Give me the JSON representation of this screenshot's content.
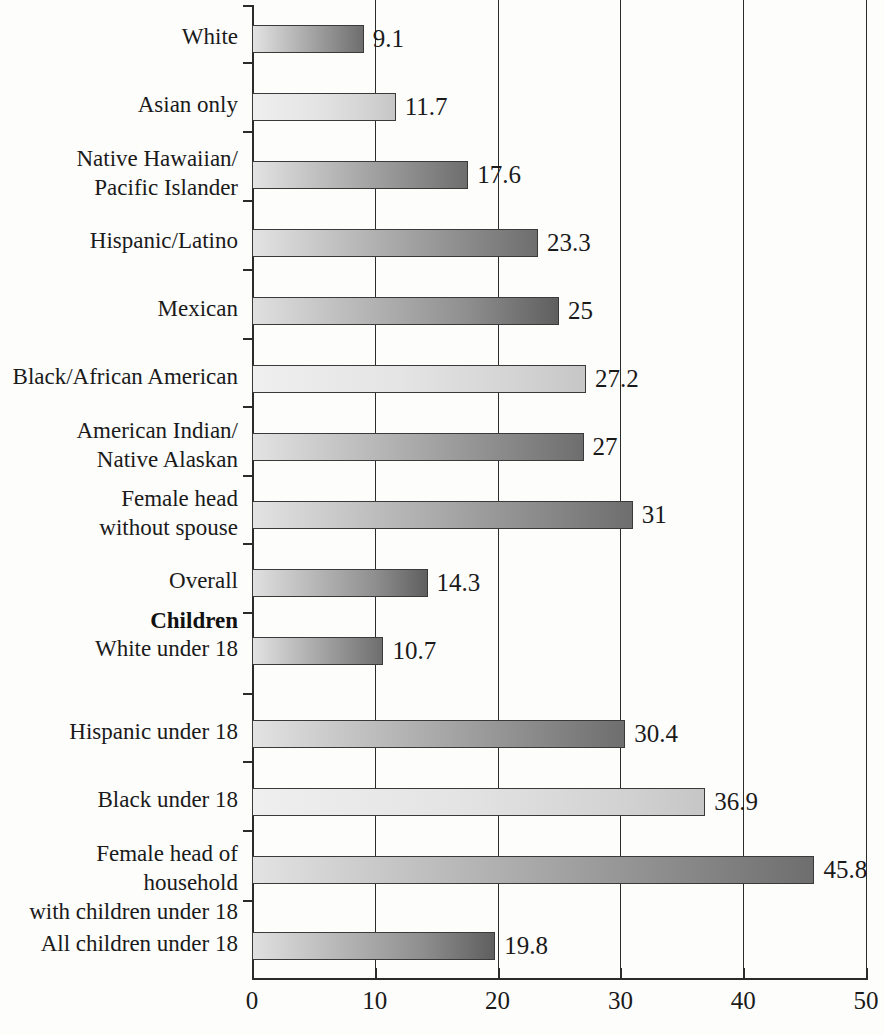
{
  "chart_data": {
    "type": "bar",
    "orientation": "horizontal",
    "title": "",
    "subtitle": "",
    "xlabel": "",
    "ylabel": "",
    "xlim": [
      0,
      50
    ],
    "xticks": [
      0,
      10,
      20,
      30,
      40,
      50
    ],
    "xticklabels": [
      "0",
      "10",
      "20",
      "30",
      "40",
      "50"
    ],
    "grid": true,
    "grid_axis": "x",
    "legend": false,
    "legend_position": "none",
    "categories": [
      "White",
      "Asian only",
      "Native Hawaiian/\nPacific Islander",
      "Hispanic/Latino",
      "Mexican",
      "Black/African American",
      "American Indian/\nNative Alaskan",
      "Female head\nwithout spouse",
      "Overall",
      "White under 18",
      "Hispanic under 18",
      "Black under 18",
      "Female head of household\nwith children under 18",
      "All children under 18"
    ],
    "values": [
      9.1,
      11.7,
      17.6,
      23.3,
      25,
      27.2,
      27,
      31,
      14.3,
      10.7,
      30.4,
      36.9,
      45.8,
      19.8
    ],
    "value_labels": [
      "9.1",
      "11.7",
      "17.6",
      "23.3",
      "25",
      "27.2",
      "27",
      "31",
      "14.3",
      "10.7",
      "30.4",
      "36.9",
      "45.8",
      "19.8"
    ],
    "group_headers": [
      {
        "label": "Children",
        "after_category_index": 8
      }
    ],
    "bar_colors": {
      "gradient_start": "#e9e9e9",
      "gradient_end": "#6e6e6e",
      "border": "#3a3a3a"
    },
    "axis_color": "#2b2b2b",
    "background": "#fdfdfc"
  },
  "rows": [
    {
      "label_line1": "White",
      "label_line2": "",
      "value": 9.1,
      "value_label": "9.1",
      "style": "g-dark",
      "top": 25,
      "label_top": 22,
      "tick_top": 5
    },
    {
      "label_line1": "Asian only",
      "label_line2": "",
      "value": 11.7,
      "value_label": "11.7",
      "style": "g-light",
      "top": 93,
      "label_top": 90,
      "tick_top": 62
    },
    {
      "label_line1": "Native Hawaiian/",
      "label_line2": "Pacific Islander",
      "value": 17.6,
      "value_label": "17.6",
      "style": "g-dark",
      "top": 161,
      "label_top": 144,
      "tick_top": 131
    },
    {
      "label_line1": "Hispanic/Latino",
      "label_line2": "",
      "value": 23.3,
      "value_label": "23.3",
      "style": "g-dark",
      "top": 229,
      "label_top": 226,
      "tick_top": 200
    },
    {
      "label_line1": "Mexican",
      "label_line2": "",
      "value": 25,
      "value_label": "25",
      "style": "g-deep",
      "top": 297,
      "label_top": 294,
      "tick_top": 269
    },
    {
      "label_line1": "Black/African American",
      "label_line2": "",
      "value": 27.2,
      "value_label": "27.2",
      "style": "g-light",
      "top": 365,
      "label_top": 362,
      "tick_top": 338
    },
    {
      "label_line1": "American Indian/",
      "label_line2": "Native Alaskan",
      "value": 27,
      "value_label": "27",
      "style": "g-dark",
      "top": 433,
      "label_top": 416,
      "tick_top": 406
    },
    {
      "label_line1": "Female head",
      "label_line2": "without spouse",
      "value": 31,
      "value_label": "31",
      "style": "g-dark",
      "top": 501,
      "label_top": 484,
      "tick_top": 475
    },
    {
      "label_line1": "Overall",
      "label_line2": "",
      "value": 14.3,
      "value_label": "14.3",
      "style": "g-deep",
      "top": 569,
      "label_top": 566,
      "tick_top": 543
    },
    {
      "label_line1": "White under 18",
      "label_line2": "",
      "value": 10.7,
      "value_label": "10.7",
      "style": "g-dark",
      "top": 637,
      "label_top": 634,
      "tick_top": 612
    },
    {
      "label_line1": "Hispanic under 18",
      "label_line2": "",
      "value": 30.4,
      "value_label": "30.4",
      "style": "g-dark",
      "top": 720,
      "label_top": 717,
      "tick_top": 693
    },
    {
      "label_line1": "Black under 18",
      "label_line2": "",
      "value": 36.9,
      "value_label": "36.9",
      "style": "g-light",
      "top": 788,
      "label_top": 785,
      "tick_top": 761
    },
    {
      "label_line1": "Female head of household",
      "label_line2": "with children under 18",
      "value": 45.8,
      "value_label": "45.8",
      "style": "g-dark",
      "top": 856,
      "label_top": 839,
      "tick_top": 830
    },
    {
      "label_line1": "All children under 18",
      "label_line2": "",
      "value": 19.8,
      "value_label": "19.8",
      "style": "g-deep",
      "top": 932,
      "label_top": 929,
      "tick_top": 900
    }
  ],
  "group_header": {
    "label": "Children",
    "top": 606
  },
  "axis": {
    "ticks": [
      {
        "label": "0",
        "value": 0
      },
      {
        "label": "10",
        "value": 10
      },
      {
        "label": "20",
        "value": 20
      },
      {
        "label": "30",
        "value": 30
      },
      {
        "label": "40",
        "value": 40
      },
      {
        "label": "50",
        "value": 50
      }
    ]
  }
}
